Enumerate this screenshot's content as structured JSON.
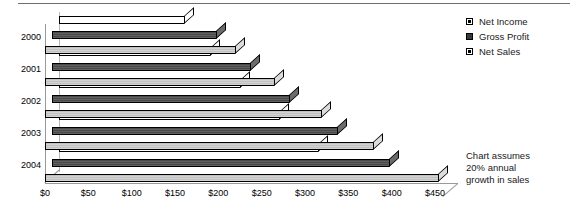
{
  "chart_data": {
    "type": "bar",
    "orientation": "horizontal",
    "style": "3d-clustered-bar",
    "title": "",
    "xlabel": "",
    "ylabel": "",
    "categories": [
      "2004",
      "2003",
      "2002",
      "2001",
      "2000"
    ],
    "series": [
      {
        "name": "Net Income",
        "values": [
          300,
          255,
          210,
          175,
          145
        ]
      },
      {
        "name": "Gross Profit",
        "values": [
          390,
          330,
          275,
          230,
          190
        ]
      },
      {
        "name": "Net Sales",
        "values": [
          455,
          380,
          320,
          265,
          220
        ]
      }
    ],
    "xlim": [
      0,
      450
    ],
    "xticks": [
      0,
      50,
      100,
      150,
      200,
      250,
      300,
      350,
      400,
      450
    ],
    "xtick_labels": [
      "$0",
      "$50",
      "$100",
      "$150",
      "$200",
      "$250",
      "$300",
      "$350",
      "$400",
      "$450"
    ],
    "ytick_labels": [
      "2004",
      "2003",
      "2002",
      "2001",
      "2000"
    ],
    "grid": false,
    "legend_position": "right-top",
    "legend_entries": [
      "Net Income",
      "Gross Profit",
      "Net Sales"
    ],
    "annotations": [
      "Chart assumes",
      "20% annual",
      "growth in sales"
    ],
    "colors": {
      "net_income": "#ffffff",
      "gross_profit": "#585858",
      "net_sales": "#c9c9c9",
      "outline": "#000000",
      "axis": "#9a9a9a",
      "text": "#000000",
      "background": "#ffffff"
    }
  },
  "legend": {
    "items": [
      {
        "label": "Net Income",
        "key": "net_income"
      },
      {
        "label": "Gross Profit",
        "key": "gross_profit"
      },
      {
        "label": "Net Sales",
        "key": "net_sales"
      }
    ]
  },
  "annotation": {
    "line1": "Chart assumes",
    "line2": "20% annual",
    "line3": "growth in sales"
  }
}
